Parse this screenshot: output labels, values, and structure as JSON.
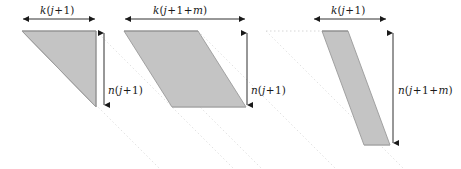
{
  "figure": {
    "type": "geometric-diagram",
    "background_color": "#ffffff",
    "fill_color": "#c4c4c4",
    "stroke_color": "#8c8c8c",
    "arrow_color": "#1a1a1a",
    "guide_color": "#dcdcdc",
    "width": 461,
    "height": 169
  },
  "blocks": [
    {
      "id": "block-1",
      "top_label": "k(j+1)",
      "side_label": "n(j+1)",
      "top_label_parts": {
        "fn": "k",
        "open": "(",
        "var": "j",
        "plus": "+",
        "one": "1",
        "close": ")"
      },
      "side_label_parts": {
        "fn": "n",
        "open": "(",
        "var": "j",
        "plus": "+",
        "one": "1",
        "close": ")"
      }
    },
    {
      "id": "block-2",
      "top_label": "k(j+1+m)",
      "side_label": "n(j+1)",
      "top_label_parts": {
        "fn": "k",
        "open": "(",
        "var": "j",
        "plus": "+",
        "one": "1",
        "plus2": "+",
        "var2": "m",
        "close": ")"
      },
      "side_label_parts": {
        "fn": "n",
        "open": "(",
        "var": "j",
        "plus": "+",
        "one": "1",
        "close": ")"
      }
    },
    {
      "id": "block-3",
      "top_label": "k(j+1)",
      "side_label": "n(j+1+m)",
      "top_label_parts": {
        "fn": "k",
        "open": "(",
        "var": "j",
        "plus": "+",
        "one": "1",
        "close": ")"
      },
      "side_label_parts": {
        "fn": "n",
        "open": "(",
        "var": "j",
        "plus": "+",
        "one": "1",
        "plus2": "+",
        "var2": "m",
        "close": ")"
      }
    }
  ],
  "labels": {
    "top_1": "k(j+1)",
    "top_2": "k(j+1+m)",
    "top_3": "k(j+1)",
    "side_1": "n(j+1)",
    "side_2": "n(j+1)",
    "side_3": "n(j+1+m)"
  }
}
